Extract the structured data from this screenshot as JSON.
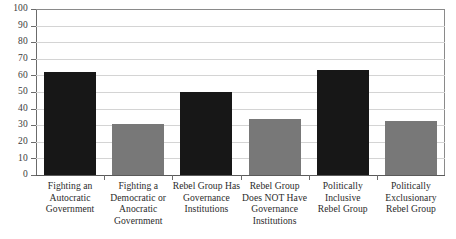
{
  "chart_data": {
    "type": "bar",
    "title": "",
    "xlabel": "",
    "ylabel": "",
    "ylim": [
      0,
      100
    ],
    "ytick_step": 10,
    "grid": true,
    "legend": "none",
    "categories": [
      "Fighting an Autocratic Government",
      "Fighting a Democratic or Anocratic Government",
      "Rebel Group Has Governance Institutions",
      "Rebel Group Does NOT Have Governance Institutions",
      "Politically Inclusive Rebel Group",
      "Politically Exclusionary Rebel Group"
    ],
    "category_lines": [
      [
        "Fighting an",
        "Autocratic",
        "Government"
      ],
      [
        "Fighting a",
        "Democratic or",
        "Anocratic",
        "Government"
      ],
      [
        "Rebel Group Has",
        "Governance",
        "Institutions"
      ],
      [
        "Rebel Group",
        "Does NOT Have",
        "Governance",
        "Institutions"
      ],
      [
        "Politically",
        "Inclusive",
        "Rebel Group"
      ],
      [
        "Politically",
        "Exclusionary",
        "Rebel Group"
      ]
    ],
    "values": [
      62,
      30.5,
      50,
      34,
      63,
      32.5
    ],
    "bar_colors": [
      "#171717",
      "#787878",
      "#171717",
      "#787878",
      "#171717",
      "#787878"
    ],
    "ytick_labels": [
      "100",
      "90",
      "80",
      "70",
      "60",
      "50",
      "40",
      "30",
      "20",
      "10",
      "0"
    ],
    "ytick_values": [
      100,
      90,
      80,
      70,
      60,
      50,
      40,
      30,
      20,
      10,
      0
    ]
  },
  "colors": {
    "dark_bar": "#171717",
    "light_bar": "#787878",
    "gridline": "#d4d4d4",
    "axis": "#6b6b6b",
    "text": "#2b2b2b",
    "background": "#ffffff"
  }
}
